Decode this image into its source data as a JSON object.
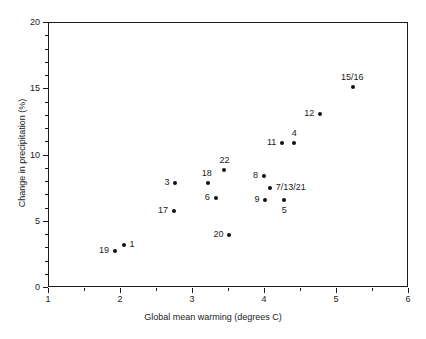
{
  "chart_data": {
    "type": "scatter",
    "title": "",
    "xlabel": "Global mean warming (degrees C)",
    "ylabel": "Change in precipitation (%)",
    "xlim": [
      1,
      6
    ],
    "ylim": [
      0,
      20
    ],
    "xticks": [
      1,
      2,
      3,
      4,
      5,
      6
    ],
    "xticklabels": [
      "1",
      "2",
      "3",
      "4",
      "5",
      "6"
    ],
    "xminorticks": [
      1.5,
      2.5,
      3.5,
      4.5,
      5.5
    ],
    "yticks": [
      0,
      5,
      10,
      15,
      20
    ],
    "yticklabels": [
      "0",
      "5",
      "10",
      "15",
      "20"
    ],
    "yminorticks": [
      1,
      2,
      3,
      4,
      6,
      7,
      8,
      9,
      11,
      12,
      13,
      14,
      16,
      17,
      18,
      19
    ],
    "grid": false,
    "legend": null,
    "marker_color": "#111111",
    "axis_color": "#1a1a1a",
    "points": [
      {
        "label": "19",
        "x": 1.93,
        "y": 2.7,
        "label_pos": "left"
      },
      {
        "label": "1",
        "x": 2.05,
        "y": 3.2,
        "label_pos": "right"
      },
      {
        "label": "3",
        "x": 2.77,
        "y": 7.85,
        "label_pos": "left"
      },
      {
        "label": "17",
        "x": 2.75,
        "y": 5.75,
        "label_pos": "left"
      },
      {
        "label": "18",
        "x": 3.22,
        "y": 7.85,
        "label_pos": "above-left"
      },
      {
        "label": "6",
        "x": 3.33,
        "y": 6.7,
        "label_pos": "left"
      },
      {
        "label": "22",
        "x": 3.45,
        "y": 8.85,
        "label_pos": "above"
      },
      {
        "label": "20",
        "x": 3.52,
        "y": 3.9,
        "label_pos": "left"
      },
      {
        "label": "8",
        "x": 4.0,
        "y": 8.35,
        "label_pos": "left"
      },
      {
        "label": "7/13/21",
        "x": 4.08,
        "y": 7.45,
        "label_pos": "right"
      },
      {
        "label": "9",
        "x": 4.02,
        "y": 6.6,
        "label_pos": "left"
      },
      {
        "label": "5",
        "x": 4.28,
        "y": 6.6,
        "label_pos": "below"
      },
      {
        "label": "11",
        "x": 4.25,
        "y": 10.9,
        "label_pos": "left"
      },
      {
        "label": "4",
        "x": 4.42,
        "y": 10.9,
        "label_pos": "above"
      },
      {
        "label": "12",
        "x": 4.78,
        "y": 13.05,
        "label_pos": "left"
      },
      {
        "label": "15/16",
        "x": 5.23,
        "y": 15.1,
        "label_pos": "above"
      }
    ]
  }
}
